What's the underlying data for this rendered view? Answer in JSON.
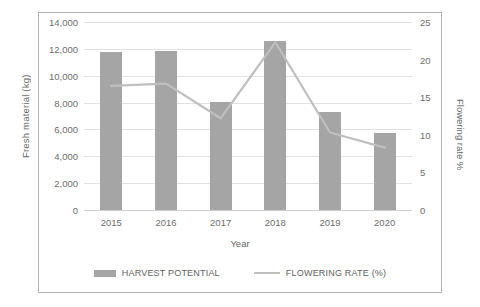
{
  "chart_data": {
    "type": "bar",
    "title": "",
    "categories": [
      "2015",
      "2016",
      "2017",
      "2018",
      "2019",
      "2020"
    ],
    "xlabel": "Year",
    "ylabel": "Fresh material  (kg)",
    "y2label": "Flowering rate %",
    "ylim": [
      0,
      14000
    ],
    "y2lim": [
      0,
      25
    ],
    "yticks": [
      "0",
      "2,000",
      "4,000",
      "6,000",
      "8,000",
      "10,000",
      "12,000",
      "14,000"
    ],
    "ytick_values": [
      0,
      2000,
      4000,
      6000,
      8000,
      10000,
      12000,
      14000
    ],
    "y2ticks": [
      "0",
      "5",
      "10",
      "15",
      "20",
      "25"
    ],
    "y2tick_values": [
      0,
      5,
      10,
      15,
      20,
      25
    ],
    "grid": true,
    "legend_position": "bottom",
    "series": [
      {
        "name": "HARVEST POTENTIAL",
        "type": "bar",
        "axis": "left",
        "color": "#a5a5a5",
        "values": [
          11750,
          11850,
          8050,
          12600,
          7300,
          5700
        ]
      },
      {
        "name": "FLOWERING RATE (%)",
        "type": "line",
        "axis": "right",
        "color": "#bfbfbf",
        "values": [
          16.5,
          16.8,
          12.2,
          22.3,
          10.3,
          8.3
        ]
      }
    ]
  },
  "legend": {
    "items": [
      {
        "label": "HARVEST POTENTIAL",
        "marker": "bar-swatch"
      },
      {
        "label": "FLOWERING RATE (%)",
        "marker": "line-swatch"
      }
    ]
  }
}
